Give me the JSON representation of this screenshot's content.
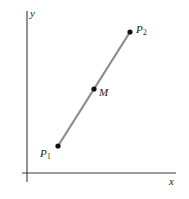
{
  "figure": {
    "title": "",
    "background_color": "#ffffff"
  },
  "axes": {
    "x_label": "x",
    "y_label": "y",
    "axis_color": "#3a3a3a",
    "x_axis": {
      "x1": 22,
      "y1": 173,
      "x2": 176,
      "y2": 173
    },
    "y_axis": {
      "x1": 27,
      "y1": 11,
      "x2": 27,
      "y2": 182
    }
  },
  "segment": {
    "color": "#8c8c8c",
    "width": 2.2,
    "from": {
      "x": 58,
      "y": 146
    },
    "to": {
      "x": 130,
      "y": 32
    }
  },
  "points": [
    {
      "id": "p1",
      "label_base": "P",
      "label_sub": "1",
      "dot_x": 58,
      "dot_y": 146,
      "dot_color": "#111111",
      "dot_radius": 2.6
    },
    {
      "id": "m",
      "label_base": "M",
      "label_sub": "",
      "dot_x": 94,
      "dot_y": 89,
      "dot_color": "#111111",
      "dot_radius": 2.6
    },
    {
      "id": "p2",
      "label_base": "P",
      "label_sub": "2",
      "dot_x": 130,
      "dot_y": 32,
      "dot_color": "#111111",
      "dot_radius": 2.6
    }
  ],
  "chart_data": {
    "type": "scatter",
    "title": "",
    "xlabel": "x",
    "ylabel": "y",
    "grid": false,
    "legend": null,
    "annotations": [
      "P1",
      "M",
      "P2"
    ],
    "series": [
      {
        "name": "segment P1 P2",
        "points": [
          {
            "label": "P1",
            "x": 58,
            "y": 146
          },
          {
            "label": "M",
            "x": 94,
            "y": 89
          },
          {
            "label": "P2",
            "x": 130,
            "y": 32
          }
        ]
      }
    ]
  }
}
